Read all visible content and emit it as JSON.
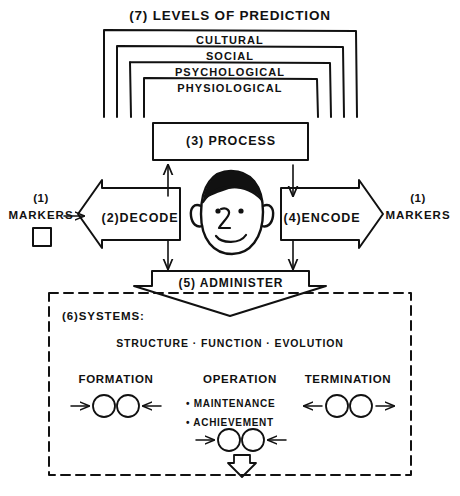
{
  "diagram": {
    "title_label": "(7) LEVELS OF PREDICTION",
    "levels": [
      {
        "num": "",
        "label": "CULTURAL"
      },
      {
        "num": "",
        "label": "SOCIAL"
      },
      {
        "num": "",
        "label": "PSYCHOLOGICAL"
      },
      {
        "num": "",
        "label": "PHYSIOLOGICAL"
      }
    ],
    "process": {
      "label": "(3) PROCESS"
    },
    "decode": {
      "label": "(2)DECODE"
    },
    "encode": {
      "label": "(4)ENCODE"
    },
    "markers_left": {
      "num": "(1)",
      "label": "MARKERS"
    },
    "markers_right": {
      "num": "(1)",
      "label": "MARKERS"
    },
    "administer": {
      "label": "(5) ADMINISTER"
    },
    "systems": {
      "heading": "(6)SYSTEMS:",
      "triad": "STRUCTURE · FUNCTION · EVOLUTION",
      "phases": [
        {
          "label": "FORMATION"
        },
        {
          "label": "OPERATION"
        },
        {
          "label": "TERMINATION"
        }
      ],
      "operation_bullets": [
        "• MAINTENANCE",
        "• ACHIEVEMENT"
      ]
    },
    "footer_caption": ""
  },
  "colors": {
    "ink": "#111111",
    "paper": "#ffffff"
  }
}
